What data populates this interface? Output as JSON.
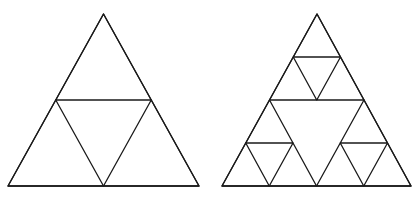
{
  "figure": {
    "line_color": "#1a1a1a",
    "background": "#ffffff",
    "panels": [
      {
        "name": "sierpinski-iteration-1",
        "iteration": 1
      },
      {
        "name": "sierpinski-iteration-2",
        "iteration": 2
      }
    ]
  }
}
